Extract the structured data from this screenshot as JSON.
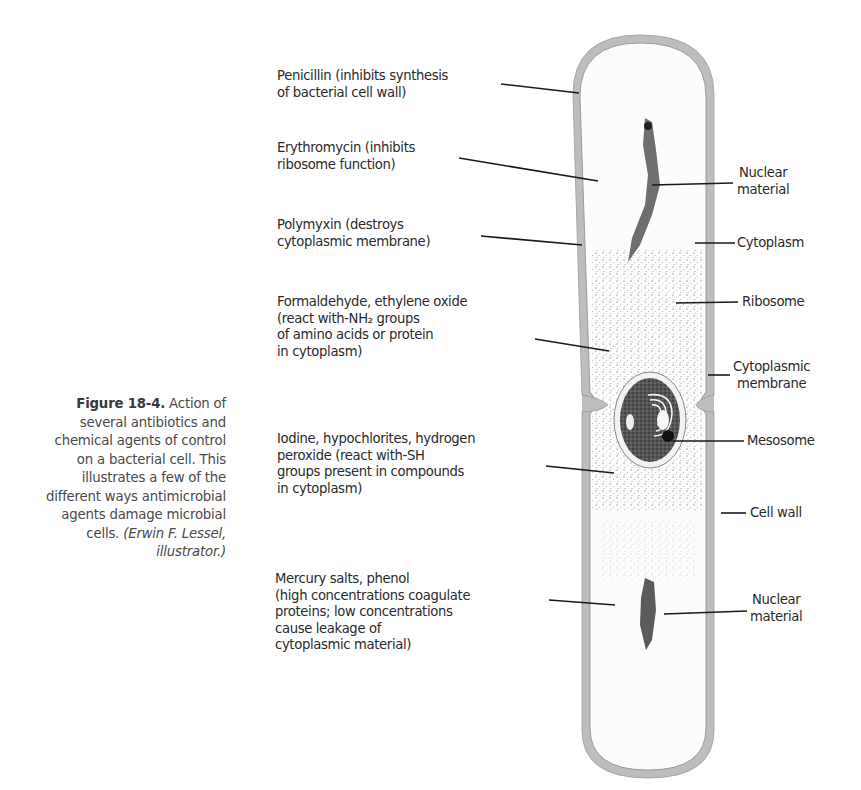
{
  "caption": {
    "figure_number": "Figure 18-4.",
    "lines": [
      " Action of",
      "several antibiotics and",
      "chemical agents of control",
      "on a bacterial cell. This",
      "illustrates a few of the",
      "different ways antimicrobial",
      "agents damage microbial",
      "cells. "
    ],
    "credit_line1": "(Erwin F. Lessel,",
    "credit_line2": "illustrator.)"
  },
  "left_labels": [
    {
      "id": "penicillin",
      "lines": [
        "Penicillin (inhibits synthesis",
        "of bacterial cell wall)"
      ]
    },
    {
      "id": "erythromycin",
      "lines": [
        "Erythromycin (inhibits",
        "ribosome function)"
      ]
    },
    {
      "id": "polymyxin",
      "lines": [
        "Polymyxin (destroys",
        "cytoplasmic membrane)"
      ]
    },
    {
      "id": "formaldehyde",
      "lines": [
        "Formaldehyde, ethylene oxide",
        "(react with-NH₂ groups",
        "of amino acids or protein",
        "in cytoplasm)"
      ]
    },
    {
      "id": "iodine",
      "lines": [
        "Iodine, hypochlorites, hydrogen",
        "peroxide (react with-SH",
        "groups present in compounds",
        "in cytoplasm)"
      ]
    },
    {
      "id": "mercury",
      "lines": [
        "Mercury salts, phenol",
        "(high concentrations coagulate",
        "proteins; low concentrations",
        "cause leakage of",
        "cytoplasmic material)"
      ]
    }
  ],
  "right_labels": [
    {
      "id": "nuclear-material-top",
      "lines": [
        "Nuclear",
        "material"
      ]
    },
    {
      "id": "cytoplasm",
      "lines": [
        "Cytoplasm"
      ]
    },
    {
      "id": "ribosome",
      "lines": [
        "Ribosome"
      ]
    },
    {
      "id": "cytoplasmic-membrane",
      "lines": [
        "Cytoplasmic",
        "membrane"
      ]
    },
    {
      "id": "mesosome",
      "lines": [
        "Mesosome"
      ]
    },
    {
      "id": "cell-wall",
      "lines": [
        "Cell wall"
      ]
    },
    {
      "id": "nuclear-material-bottom",
      "lines": [
        "Nuclear",
        "material"
      ]
    }
  ],
  "colors": {
    "cell_wall": "#b9b9b9",
    "cytoplasm": "#fbfbfb",
    "nucleoid": "#3c3c3c",
    "leader_line": "#1a1a1a",
    "text": "#2a2a2a"
  }
}
